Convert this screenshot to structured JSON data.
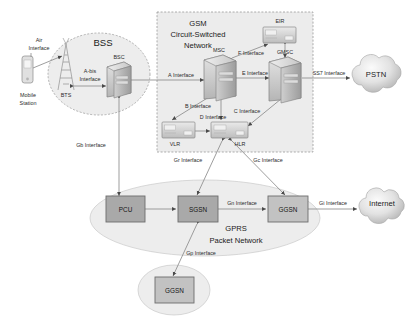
{
  "diagram": {
    "zones": {
      "bss": {
        "label": "BSS"
      },
      "gsm": {
        "label": "GSM\nCircuit-Switched\nNetwork",
        "line1": "GSM",
        "line2": "Circuit-Switched",
        "line3": "Network"
      },
      "gprs": {
        "label": "GPRS\nPacket Network",
        "line1": "GPRS",
        "line2": "Packet Network"
      }
    },
    "nodes": {
      "mobile_station": {
        "label": "Mobile\nStation",
        "line1": "Mobile",
        "line2": "Station",
        "icon": "mobile-phone-icon"
      },
      "bts": {
        "label": "BTS",
        "icon": "antenna-tower-icon"
      },
      "bsc": {
        "label": "BSC",
        "icon": "server-icon"
      },
      "msc": {
        "label": "MSC",
        "icon": "server-icon"
      },
      "gmsc": {
        "label": "GMSC",
        "icon": "server-icon"
      },
      "eir": {
        "label": "EIR",
        "icon": "database-box-icon"
      },
      "vlr": {
        "label": "VLR",
        "icon": "database-box-icon"
      },
      "hlr": {
        "label": "HLR",
        "icon": "database-box-icon"
      },
      "pcu": {
        "label": "PCU",
        "icon": "rect-node-icon"
      },
      "sgsn": {
        "label": "SGSN",
        "icon": "rect-node-icon"
      },
      "ggsn": {
        "label": "GGSN",
        "icon": "rect-node-icon"
      },
      "ggsn_remote": {
        "label": "GGSN",
        "icon": "rect-node-icon"
      },
      "pstn": {
        "label": "PSTN",
        "icon": "cloud-icon"
      },
      "internet": {
        "label": "Internet",
        "icon": "cloud-icon"
      }
    },
    "interfaces": {
      "air": {
        "label": "Air\nInterface",
        "line1": "Air",
        "line2": "Interface"
      },
      "abis": {
        "label": "A-bis\nInterface",
        "line1": "A-bis",
        "line2": "Interface"
      },
      "a": {
        "label": "A Interface"
      },
      "b": {
        "label": "B Interface"
      },
      "c": {
        "label": "C Interface"
      },
      "d": {
        "label": "D Interface"
      },
      "e": {
        "label": "E Interface"
      },
      "f": {
        "label": "F Interface"
      },
      "ss7": {
        "label": "SS7 Interface"
      },
      "gb": {
        "label": "Gb Interface"
      },
      "gr": {
        "label": "Gr Interface"
      },
      "gc": {
        "label": "Gc Interface"
      },
      "gn": {
        "label": "Gn Interface"
      },
      "gi": {
        "label": "Gi Interface"
      },
      "gp": {
        "label": "Gp Interface"
      }
    },
    "colors": {
      "zone_fill": "#ededed",
      "node_fill": "#a9a9a9",
      "node_fill_light": "#c9c9c9",
      "stroke": "#6f6f6f",
      "line": "#8f8f8f",
      "text": "#1a1a1a"
    }
  }
}
